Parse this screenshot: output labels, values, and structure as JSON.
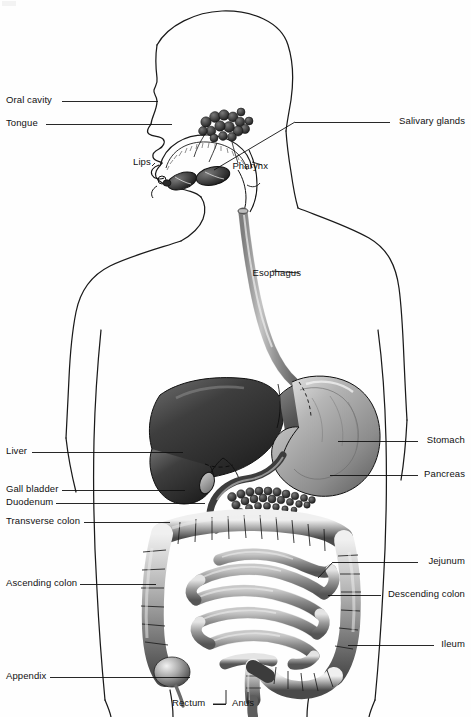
{
  "figure": {
    "type": "anatomical-diagram",
    "background_color": "#ffffff",
    "ink_color": "#111111",
    "width": 471,
    "height": 717
  },
  "labels": {
    "left": [
      {
        "id": "oral-cavity",
        "text": "Oral cavity",
        "text_x": 6,
        "text_y": 104,
        "line_x1": 62,
        "line_y1": 101,
        "line_x2": 158,
        "line_y2": 101
      },
      {
        "id": "tongue",
        "text": "Tongue",
        "text_x": 6,
        "text_y": 127,
        "line_x1": 46,
        "line_y1": 124,
        "line_x2": 172,
        "line_y2": 124
      },
      {
        "id": "lips",
        "text": "Lips",
        "text_x": 133,
        "text_y": 166,
        "line_x1": 0,
        "line_y1": 0,
        "line_x2": 0,
        "line_y2": 0
      },
      {
        "id": "liver",
        "text": "Liver",
        "text_x": 6,
        "text_y": 455,
        "line_x1": 32,
        "line_y1": 452,
        "line_x2": 183,
        "line_y2": 452
      },
      {
        "id": "gall-bladder",
        "text": "Gall bladder",
        "text_x": 6,
        "text_y": 493,
        "line_x1": 62,
        "line_y1": 490,
        "line_x2": 185,
        "line_y2": 490
      },
      {
        "id": "duodenum",
        "text": "Duodenum",
        "text_x": 6,
        "text_y": 506,
        "line_x1": 56,
        "line_y1": 503,
        "line_x2": 205,
        "line_y2": 503
      },
      {
        "id": "transverse-colon",
        "text": "Transverse colon",
        "text_x": 6,
        "text_y": 525,
        "line_x1": 84,
        "line_y1": 522,
        "line_x2": 170,
        "line_y2": 522
      },
      {
        "id": "ascending-colon",
        "text": "Ascending colon",
        "text_x": 6,
        "text_y": 587,
        "line_x1": 80,
        "line_y1": 584,
        "line_x2": 156,
        "line_y2": 584
      },
      {
        "id": "appendix",
        "text": "Appendix",
        "text_x": 6,
        "text_y": 680,
        "line_x1": 50,
        "line_y1": 677,
        "line_x2": 190,
        "line_y2": 677
      }
    ],
    "right": [
      {
        "id": "salivary-glands",
        "text": "Salivary glands",
        "text_x": 465,
        "text_y": 125,
        "line_x1": 390,
        "line_y1": 122,
        "line_x2": 295,
        "line_y2": 122
      },
      {
        "id": "pharynx",
        "text": "Pharynx",
        "text_x": 268,
        "text_y": 170,
        "line_x1": 0,
        "line_y1": 0,
        "line_x2": 0,
        "line_y2": 0
      },
      {
        "id": "esophagus",
        "text": "Esophagus",
        "text_x": 301,
        "text_y": 277,
        "line_x1": 0,
        "line_y1": 0,
        "line_x2": 0,
        "line_y2": 0
      },
      {
        "id": "stomach",
        "text": "Stomach",
        "text_x": 465,
        "text_y": 444,
        "line_x1": 418,
        "line_y1": 441,
        "line_x2": 338,
        "line_y2": 441
      },
      {
        "id": "pancreas",
        "text": "Pancreas",
        "text_x": 465,
        "text_y": 478,
        "line_x1": 418,
        "line_y1": 475,
        "line_x2": 330,
        "line_y2": 475
      },
      {
        "id": "jejunum",
        "text": "Jejunum",
        "text_x": 465,
        "text_y": 565,
        "line_x1": 418,
        "line_y1": 562,
        "line_x2": 333,
        "line_y2": 562
      },
      {
        "id": "descending-colon",
        "text": "Descending colon",
        "text_x": 465,
        "text_y": 598,
        "line_x1": 381,
        "line_y1": 595,
        "line_x2": 328,
        "line_y2": 595
      },
      {
        "id": "ileum",
        "text": "Ileum",
        "text_x": 465,
        "text_y": 648,
        "line_x1": 434,
        "line_y1": 645,
        "line_x2": 348,
        "line_y2": 645
      }
    ],
    "bottom": [
      {
        "id": "rectum",
        "text": "Rectum",
        "text_x": 172,
        "text_y": 707,
        "line_x1": 213,
        "line_y1": 704,
        "line_x2": 226,
        "line_y2": 704
      },
      {
        "id": "anus",
        "text": "Anus",
        "text_x": 232,
        "text_y": 707,
        "line_x1": 0,
        "line_y1": 0,
        "line_x2": 0,
        "line_y2": 0
      }
    ]
  },
  "organs": [
    "oral cavity",
    "tongue",
    "lips",
    "salivary glands",
    "pharynx",
    "esophagus",
    "liver",
    "stomach",
    "gall bladder",
    "pancreas",
    "duodenum",
    "jejunum",
    "ileum",
    "transverse colon",
    "ascending colon",
    "descending colon",
    "appendix",
    "rectum",
    "anus"
  ]
}
